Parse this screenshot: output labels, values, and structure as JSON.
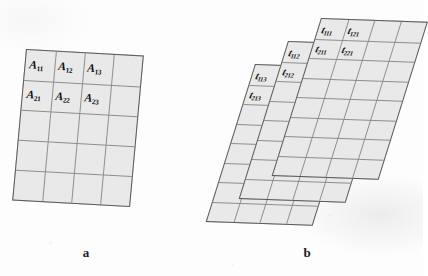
{
  "figure": {
    "kind": "textbook-illustration",
    "panels": [
      {
        "id": "a",
        "caption": "a",
        "grid": {
          "columns": 4,
          "rows": 5
        },
        "style": {
          "fill": "#e9e9e9",
          "border": "#58585a",
          "gridline": "#8e8e90"
        },
        "labels": [
          {
            "base": "A",
            "sub": "11",
            "col": 0,
            "row": 0
          },
          {
            "base": "A",
            "sub": "12",
            "col": 1,
            "row": 0
          },
          {
            "base": "A",
            "sub": "13",
            "col": 2,
            "row": 0
          },
          {
            "base": "A",
            "sub": "21",
            "col": 0,
            "row": 1
          },
          {
            "base": "A",
            "sub": "22",
            "col": 1,
            "row": 1
          },
          {
            "base": "A",
            "sub": "23",
            "col": 2,
            "row": 1
          }
        ]
      },
      {
        "id": "b",
        "caption": "b",
        "grid": {
          "columns": 4,
          "rows": 8
        },
        "slice_count": 3,
        "style": {
          "fill": "#e9e9e9",
          "border": "#58585a",
          "gridline": "#8e8e90"
        },
        "slices": [
          {
            "name": "front-slice",
            "index": 1,
            "labels": [
              {
                "base": "t",
                "sub": "111",
                "col": 0,
                "row": 0
              },
              {
                "base": "t",
                "sub": "121",
                "col": 1,
                "row": 0
              },
              {
                "base": "t",
                "sub": "211",
                "col": 0,
                "row": 1
              },
              {
                "base": "t",
                "sub": "221",
                "col": 1,
                "row": 1
              }
            ]
          },
          {
            "name": "middle-slice",
            "index": 2,
            "labels": [
              {
                "base": "t",
                "sub": "112",
                "col": 0,
                "row": 0
              },
              {
                "base": "t",
                "sub": "212",
                "col": 0,
                "row": 1
              }
            ]
          },
          {
            "name": "back-slice",
            "index": 3,
            "labels": [
              {
                "base": "t",
                "sub": "113",
                "col": 0,
                "row": 0
              },
              {
                "base": "t",
                "sub": "213",
                "col": 0,
                "row": 1
              }
            ]
          }
        ]
      }
    ]
  }
}
